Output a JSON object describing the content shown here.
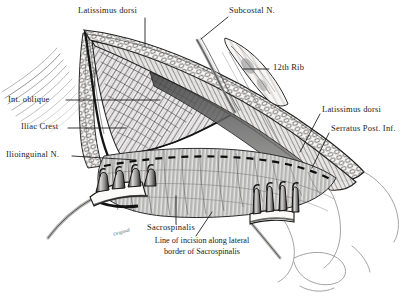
{
  "figure": {
    "style": "pen-and-ink anatomical illustration",
    "background_color": "#ffffff",
    "ink_color": "#1a1a1a"
  },
  "labels": [
    {
      "id": "latissimus-dorsi-top",
      "text": "Latissimus dorsi",
      "x": 78,
      "y": 8,
      "leader": "vertical-down"
    },
    {
      "id": "subcostal-nerve",
      "text": "Subcostal N.",
      "x": 204,
      "y": 8,
      "leader": "down-left"
    },
    {
      "id": "twelfth-rib",
      "text": "12th Rib",
      "x": 272,
      "y": 65,
      "leader": "left"
    },
    {
      "id": "internal-oblique",
      "text": "Int. oblique",
      "x": 10,
      "y": 96,
      "leader": "right"
    },
    {
      "id": "iliac-crest",
      "text": "Iliac Crest",
      "x": 24,
      "y": 124,
      "leader": "right"
    },
    {
      "id": "ilioinguinal-nerve",
      "text": "Ilioinguinal N.",
      "x": 8,
      "y": 152,
      "leader": "right"
    },
    {
      "id": "latissimus-dorsi-right",
      "text": "Latissimus dorsi",
      "x": 322,
      "y": 108,
      "leader": "down-left"
    },
    {
      "id": "serratus-post-inf",
      "text": "Serratus Post. Inf.",
      "x": 331,
      "y": 127,
      "leader": "down-left"
    },
    {
      "id": "sacrospinalis",
      "text": "Sacrospinalis",
      "x": 147,
      "y": 226,
      "leader": "up"
    }
  ],
  "caption": {
    "line1": "Line of incision along lateral",
    "line2": "border of Sacrospinalis",
    "x": 116,
    "y": 240
  },
  "signature": {
    "text": "Original",
    "x": 120,
    "y": 233
  },
  "structures": [
    {
      "name": "skin-and-fat-flap-left",
      "type": "tissue-flap"
    },
    {
      "name": "lumbodorsal-fascia-edge",
      "type": "fascia-band"
    },
    {
      "name": "internal-oblique-muscle",
      "type": "muscle-hatched-triangle"
    },
    {
      "name": "sacrospinalis-muscle",
      "type": "muscle-vertical-fibers"
    },
    {
      "name": "twelfth-rib-bone",
      "type": "bone"
    },
    {
      "name": "subcostal-nerve-strand",
      "type": "nerve"
    },
    {
      "name": "incision-dashed-line",
      "type": "dashed-guide"
    },
    {
      "name": "rake-retractor-left",
      "type": "instrument",
      "prongs": 4
    },
    {
      "name": "rake-retractor-right",
      "type": "instrument",
      "prongs": 4
    }
  ]
}
